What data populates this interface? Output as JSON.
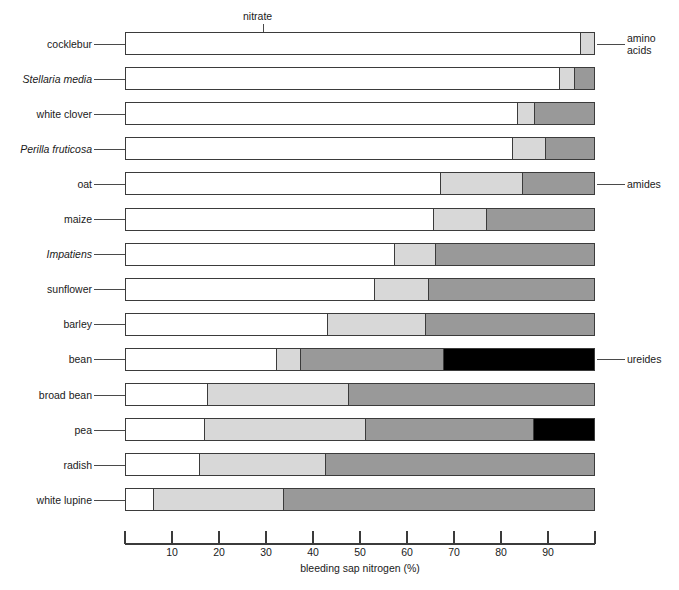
{
  "chart_data": {
    "type": "bar",
    "orientation": "horizontal",
    "stacked": true,
    "title": "",
    "xlabel": "bleeding sap nitrogen (%)",
    "ylabel": "",
    "xlim": [
      0,
      100
    ],
    "xticks": [
      0,
      10,
      20,
      30,
      40,
      50,
      60,
      70,
      80,
      90,
      100
    ],
    "xticklabels": [
      "",
      "10",
      "20",
      "30",
      "40",
      "50",
      "60",
      "70",
      "80",
      "90",
      ""
    ],
    "grid": false,
    "legend_position": "callout-annotations",
    "series": [
      {
        "name": "nitrate",
        "color": "#ffffff"
      },
      {
        "name": "amino acids",
        "color": "#d8d8d8"
      },
      {
        "name": "amides",
        "color": "#999999"
      },
      {
        "name": "ureides",
        "color": "#000000"
      }
    ],
    "categories": [
      "cocklebur",
      "Stellaria media",
      "white clover",
      "Perilla fruticosa",
      "oat",
      "maize",
      "Impatiens",
      "sunflower",
      "barley",
      "bean",
      "broad bean",
      "pea",
      "radish",
      "white lupine"
    ],
    "rows": [
      {
        "label": "cocklebur",
        "italic": false,
        "values": {
          "nitrate": 97.0,
          "amino acids": 3.0,
          "amides": 0.0,
          "ureides": 0.0
        }
      },
      {
        "label": "Stellaria media",
        "italic": true,
        "values": {
          "nitrate": 92.5,
          "amino acids": 3.2,
          "amides": 4.3,
          "ureides": 0.0
        }
      },
      {
        "label": "white clover",
        "italic": false,
        "values": {
          "nitrate": 83.5,
          "amino acids": 3.7,
          "amides": 12.8,
          "ureides": 0.0
        }
      },
      {
        "label": "Perilla fruticosa",
        "italic": true,
        "values": {
          "nitrate": 82.5,
          "amino acids": 7.1,
          "amides": 10.4,
          "ureides": 0.0
        }
      },
      {
        "label": "oat",
        "italic": false,
        "values": {
          "nitrate": 67.0,
          "amino acids": 17.7,
          "amides": 15.3,
          "ureides": 0.0
        }
      },
      {
        "label": "maize",
        "italic": false,
        "values": {
          "nitrate": 65.7,
          "amino acids": 11.3,
          "amides": 23.0,
          "ureides": 0.0
        }
      },
      {
        "label": "Impatiens",
        "italic": true,
        "values": {
          "nitrate": 57.2,
          "amino acids": 8.8,
          "amides": 34.0,
          "ureides": 0.0
        }
      },
      {
        "label": "sunflower",
        "italic": false,
        "values": {
          "nitrate": 53.0,
          "amino acids": 11.5,
          "amides": 35.5,
          "ureides": 0.0
        }
      },
      {
        "label": "barley",
        "italic": false,
        "values": {
          "nitrate": 43.0,
          "amino acids": 20.8,
          "amides": 36.2,
          "ureides": 0.0
        }
      },
      {
        "label": "bean",
        "italic": false,
        "values": {
          "nitrate": 32.0,
          "amino acids": 5.2,
          "amides": 30.5,
          "ureides": 32.3
        }
      },
      {
        "label": "broad bean",
        "italic": false,
        "values": {
          "nitrate": 17.4,
          "amino acids": 30.1,
          "amides": 52.5,
          "ureides": 0.0
        }
      },
      {
        "label": "pea",
        "italic": false,
        "values": {
          "nitrate": 16.7,
          "amino acids": 34.3,
          "amides": 36.0,
          "ureides": 13.0
        }
      },
      {
        "label": "radish",
        "italic": false,
        "values": {
          "nitrate": 15.6,
          "amino acids": 26.9,
          "amides": 57.5,
          "ureides": 0.0
        }
      },
      {
        "label": "white lupine",
        "italic": false,
        "values": {
          "nitrate": 5.7,
          "amino acids": 27.8,
          "amides": 66.5,
          "ureides": 0.0
        }
      }
    ],
    "annotations": [
      {
        "key": "nitrate",
        "text": "nitrate",
        "position": "top",
        "target_row": "cocklebur"
      },
      {
        "key": "amino_acids",
        "text": "amino\nacids",
        "position": "right",
        "target_row": "cocklebur"
      },
      {
        "key": "amides",
        "text": "amides",
        "position": "right",
        "target_row": "oat"
      },
      {
        "key": "ureides",
        "text": "ureides",
        "position": "right",
        "target_row": "bean"
      }
    ]
  },
  "annotations": {
    "nitrate": "nitrate",
    "amino_acids_line1": "amino",
    "amino_acids_line2": "acids",
    "amides": "amides",
    "ureides": "ureides"
  },
  "axis": {
    "xlabel": "bleeding sap nitrogen (%)",
    "ticklabels": [
      "10",
      "20",
      "30",
      "40",
      "50",
      "60",
      "70",
      "80",
      "90"
    ]
  },
  "colors": {
    "nitrate": "#ffffff",
    "amino_acids": "#d8d8d8",
    "amides": "#999999",
    "ureides": "#000000",
    "outline": "#3b3b3b",
    "leader": "#4a4a4a",
    "text": "#1a1a1a"
  }
}
